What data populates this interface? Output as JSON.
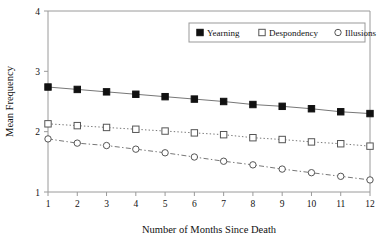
{
  "chart_data": {
    "type": "line",
    "title": "",
    "xlabel": "Number of Months Since Death",
    "ylabel": "Mean Frequency",
    "x": [
      1,
      2,
      3,
      4,
      5,
      6,
      7,
      8,
      9,
      10,
      11,
      12
    ],
    "xtick_labels": [
      "1",
      "2",
      "3",
      "4",
      "5",
      "6",
      "7",
      "8",
      "9",
      "10",
      "11",
      "12"
    ],
    "ytick_labels": [
      "1",
      "2",
      "3",
      "4"
    ],
    "yticks": [
      1,
      2,
      3,
      4
    ],
    "xlim": [
      1,
      12
    ],
    "ylim": [
      1,
      4
    ],
    "grid": false,
    "legend_position": "top-right",
    "series": [
      {
        "name": "Yearning",
        "marker": "filled-square",
        "line_style": "solid",
        "color": "#000000",
        "values": [
          2.74,
          2.7,
          2.66,
          2.62,
          2.58,
          2.54,
          2.5,
          2.45,
          2.42,
          2.38,
          2.33,
          2.3
        ]
      },
      {
        "name": "Despondency",
        "marker": "open-square",
        "line_style": "dotted",
        "color": "#000000",
        "values": [
          2.13,
          2.1,
          2.07,
          2.04,
          2.01,
          1.98,
          1.95,
          1.9,
          1.87,
          1.83,
          1.8,
          1.76
        ]
      },
      {
        "name": "Illusions",
        "marker": "open-circle",
        "line_style": "dash-dot",
        "color": "#000000",
        "values": [
          1.88,
          1.81,
          1.77,
          1.71,
          1.65,
          1.58,
          1.51,
          1.45,
          1.38,
          1.32,
          1.26,
          1.2
        ]
      }
    ]
  },
  "axes": {
    "y_title": "Mean Frequency",
    "x_title": "Number of Months Since Death"
  },
  "legend": {
    "entries": [
      {
        "label": "Yearning",
        "marker": "filled-square"
      },
      {
        "label": "Despondency",
        "marker": "open-square"
      },
      {
        "label": "Illusions",
        "marker": "open-circle"
      }
    ]
  }
}
